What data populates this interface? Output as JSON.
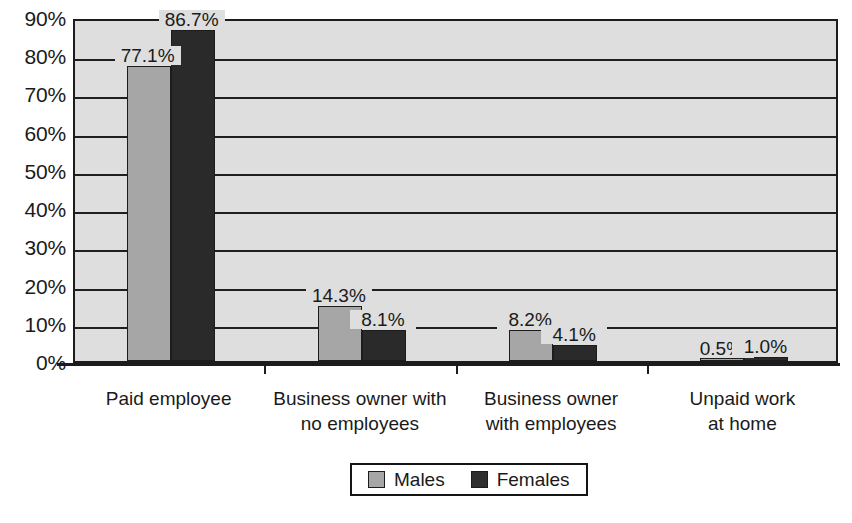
{
  "chart_data": {
    "type": "bar",
    "title": "",
    "subtitle": "",
    "xlabel": "",
    "ylabel": "",
    "ylim": [
      0,
      90
    ],
    "ytick_labels": [
      "90%",
      "80%",
      "70%",
      "60%",
      "50%",
      "40%",
      "30%",
      "20%",
      "10%",
      "0%"
    ],
    "ytick_values": [
      90,
      80,
      70,
      60,
      50,
      40,
      30,
      20,
      10,
      0
    ],
    "grid": true,
    "grid_axis": "y",
    "legend_position": "bottom",
    "value_format": "percent-one-decimal",
    "categories": [
      "Paid employee",
      "Business owner with no employees",
      "Business owner with employees",
      "Unpaid work at home"
    ],
    "category_lines": [
      [
        "Paid employee"
      ],
      [
        "Business owner with",
        "no employees"
      ],
      [
        "Business owner",
        "with employees"
      ],
      [
        "Unpaid work",
        "at home"
      ]
    ],
    "series": [
      {
        "name": "Males",
        "color": "#a6a6a6",
        "values": [
          77.1,
          14.3,
          8.2,
          0.5
        ],
        "labels": [
          "77.1%",
          "14.3%",
          "8.2%",
          "0.5%"
        ]
      },
      {
        "name": "Females",
        "color": "#2a2a2a",
        "values": [
          86.7,
          8.1,
          4.1,
          1.0
        ],
        "labels": [
          "86.7%",
          "8.1%",
          "4.1%",
          "1.0%"
        ]
      }
    ],
    "legend_entries": [
      {
        "label": "Males",
        "color": "#a6a6a6"
      },
      {
        "label": "Females",
        "color": "#2a2a2a"
      }
    ],
    "plot_background": "#dedede",
    "axis_color": "#1c1c1c"
  }
}
